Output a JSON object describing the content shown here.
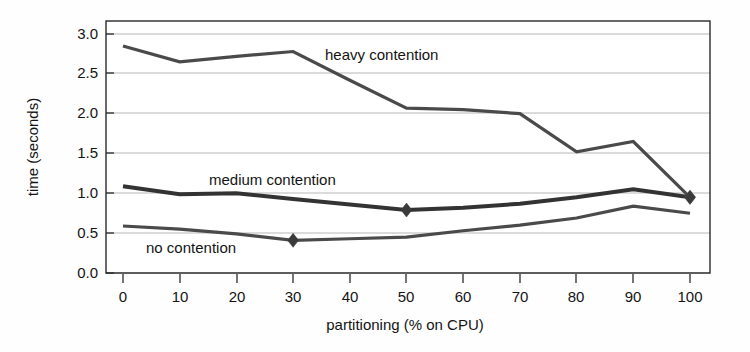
{
  "chart_data": {
    "type": "line",
    "title": "",
    "xlabel": "partitioning (% on CPU)",
    "ylabel": "time (seconds)",
    "xlim": [
      0,
      100
    ],
    "ylim": [
      0.0,
      3.0
    ],
    "grid": true,
    "legend": "inline-annotations",
    "x": [
      0,
      10,
      20,
      30,
      40,
      50,
      60,
      70,
      80,
      90,
      100
    ],
    "xticks": [
      "0",
      "10",
      "20",
      "30",
      "40",
      "50",
      "60",
      "70",
      "80",
      "90",
      "100"
    ],
    "yticks": [
      "0.0",
      "0.5",
      "1.0",
      "1.5",
      "2.0",
      "2.5",
      "3.0"
    ],
    "ytick_values": [
      0.0,
      0.5,
      1.0,
      1.5,
      2.0,
      2.5,
      3.0
    ],
    "series": [
      {
        "name": "heavy contention",
        "label": "heavy contention",
        "color": "#4a4a4a",
        "values": [
          2.85,
          2.65,
          2.72,
          2.78,
          2.42,
          2.07,
          2.05,
          2.0,
          1.52,
          1.65,
          0.95
        ],
        "markers": [
          {
            "x": 100,
            "y": 0.95
          }
        ]
      },
      {
        "name": "medium contention",
        "label": "medium contention",
        "color": "#333333",
        "values": [
          1.09,
          0.99,
          1.0,
          0.93,
          0.86,
          0.79,
          0.82,
          0.87,
          0.95,
          1.05,
          0.95
        ],
        "markers": [
          {
            "x": 50,
            "y": 0.79
          },
          {
            "x": 100,
            "y": 0.95
          }
        ]
      },
      {
        "name": "no contention",
        "label": "no contention",
        "color": "#4a4a4a",
        "values": [
          0.59,
          0.55,
          0.49,
          0.41,
          0.43,
          0.45,
          0.53,
          0.6,
          0.69,
          0.84,
          0.75
        ],
        "markers": [
          {
            "x": 30,
            "y": 0.41
          }
        ]
      }
    ],
    "annotations": [
      {
        "text": "heavy contention",
        "x": 35,
        "y": 2.72
      },
      {
        "text": "medium contention",
        "x": 24,
        "y": 1.17
      },
      {
        "text": "no contention",
        "x": 13,
        "y": 0.3
      }
    ]
  },
  "axis": {
    "ylabel": "time (seconds)",
    "xlabel": "partitioning (% on CPU)",
    "ytick_0": "0.0",
    "ytick_1": "0.5",
    "ytick_2": "1.0",
    "ytick_3": "1.5",
    "ytick_4": "2.0",
    "ytick_5": "2.5",
    "ytick_6": "3.0",
    "xtick_0": "0",
    "xtick_1": "10",
    "xtick_2": "20",
    "xtick_3": "30",
    "xtick_4": "40",
    "xtick_5": "50",
    "xtick_6": "60",
    "xtick_7": "70",
    "xtick_8": "80",
    "xtick_9": "90",
    "xtick_10": "100"
  },
  "labels": {
    "heavy": "heavy contention",
    "medium": "medium contention",
    "no": "no contention"
  }
}
